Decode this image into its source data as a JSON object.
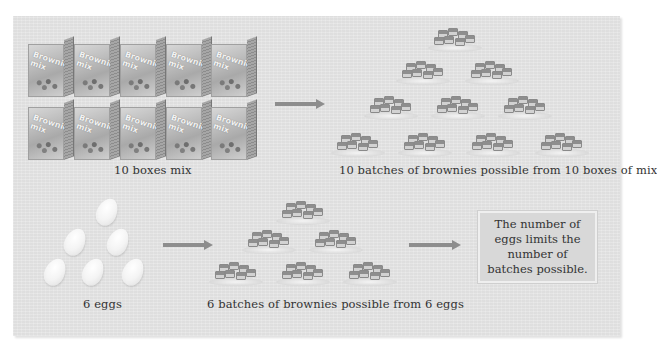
{
  "figure": {
    "top_row": {
      "input_label": "10 boxes mix",
      "input_item_count": 10,
      "input_item_icon": "brownie-mix-box-icon",
      "box_brand_text": "Brownie mix",
      "arrow_icon": "right-arrow-icon",
      "output_label": "10 batches of brownies possible from 10 boxes of mix",
      "output_item_count": 10,
      "output_item_icon": "brownie-plate-icon"
    },
    "bottom_row": {
      "input_label": "6 eggs",
      "input_item_count": 6,
      "input_item_icon": "egg-icon",
      "arrow_icon": "right-arrow-icon",
      "output_label": "6 batches of brownies possible from 6 eggs",
      "output_item_count": 6,
      "output_item_icon": "brownie-plate-icon",
      "conclusion_text": "The number of\neggs limits the\nnumber of\nbatches possible."
    },
    "colors": {
      "panel_background": "#e6e6e6",
      "arrow": "#8d8d8d",
      "callout_background": "#d8d8d8",
      "text": "#333333"
    }
  }
}
